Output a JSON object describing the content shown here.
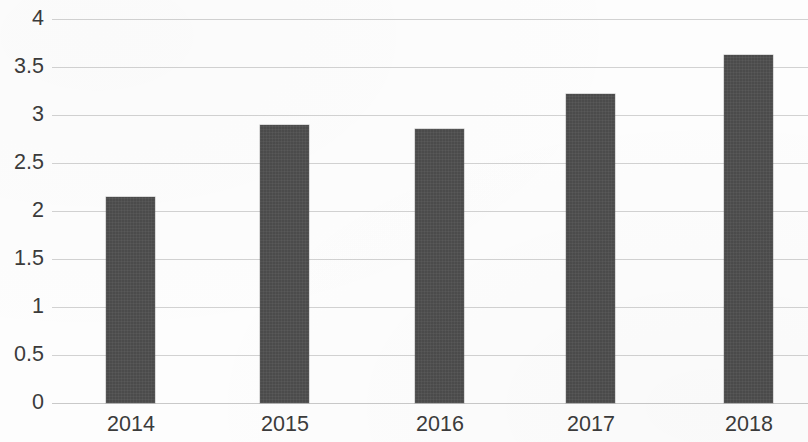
{
  "chart_data": {
    "type": "bar",
    "title": "",
    "subtitle": "",
    "xlabel": "",
    "ylabel": "",
    "categories": [
      "2014",
      "2015",
      "2016",
      "2017",
      "2018"
    ],
    "values": [
      2.15,
      2.9,
      2.85,
      3.22,
      3.62
    ],
    "series": [
      {
        "name": "",
        "values": [
          2.15,
          2.9,
          2.85,
          3.22,
          3.62
        ]
      }
    ],
    "ylim": [
      0,
      4
    ],
    "xlim": [
      0,
      5
    ],
    "y_ticks": [
      "0",
      "0.5",
      "1",
      "1.5",
      "2",
      "2.5",
      "3",
      "3.5",
      "4"
    ],
    "y_tick_values": [
      0,
      0.5,
      1,
      1.5,
      2,
      2.5,
      3,
      3.5,
      4
    ],
    "x_ticks": [
      "2014",
      "2015",
      "2016",
      "2017",
      "2018"
    ],
    "grid": true,
    "grid_axis": "y",
    "legend": false,
    "legend_position": "none",
    "annotations": [],
    "data_labels": false,
    "colors": {
      "bar": "#4b4b4b",
      "gridline": "#d2d2d2",
      "axis_text": "#3b3b3b",
      "background": "#fdfdfd"
    }
  }
}
